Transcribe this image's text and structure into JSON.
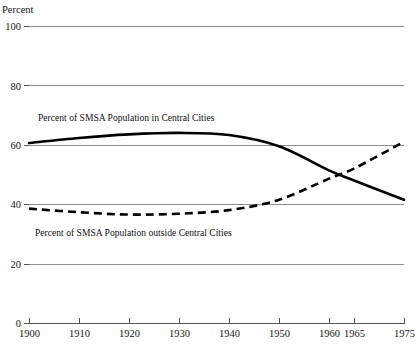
{
  "chart_data": {
    "type": "line",
    "title": "",
    "ylabel": "Percent",
    "xlabel": "",
    "ylim": [
      0,
      100
    ],
    "xlim": [
      1900,
      1975
    ],
    "grid": true,
    "legend_position": "inline-annotations",
    "y_ticks": [
      0,
      20,
      40,
      60,
      80,
      100
    ],
    "y_tick_labels": [
      "0",
      "20",
      "40",
      "60",
      "80",
      "100"
    ],
    "x_ticks": [
      1900,
      1910,
      1920,
      1930,
      1940,
      1950,
      1960,
      1965,
      1975
    ],
    "x_tick_labels": [
      "1900",
      "1910",
      "1920",
      "1930",
      "1940",
      "1950",
      "1960",
      "1965",
      "1975"
    ],
    "series": [
      {
        "name": "Percent of SMSA Population in Central Cities",
        "style": "solid",
        "color": "#000000",
        "x": [
          1900,
          1910,
          1920,
          1930,
          1940,
          1950,
          1960,
          1965,
          1975
        ],
        "values": [
          60.6,
          62.3,
          63.5,
          64.0,
          63.3,
          59.5,
          51.4,
          48.0,
          41.5
        ]
      },
      {
        "name": "Percent of SMSA Population outside Central Cities",
        "style": "dashed",
        "color": "#000000",
        "x": [
          1900,
          1910,
          1920,
          1930,
          1940,
          1950,
          1960,
          1965,
          1975
        ],
        "values": [
          38.5,
          37.3,
          36.5,
          36.8,
          38.0,
          41.5,
          48.6,
          52.0,
          61.0
        ]
      }
    ],
    "annotations": [
      {
        "text": "Percent of SMSA Population in Central Cities",
        "x_px": 38,
        "y_px": 121
      },
      {
        "text": "Percent of SMSA Population outside Central Cities",
        "x_px": 35,
        "y_px": 236
      }
    ]
  },
  "axis": {
    "y_title": "Percent"
  }
}
